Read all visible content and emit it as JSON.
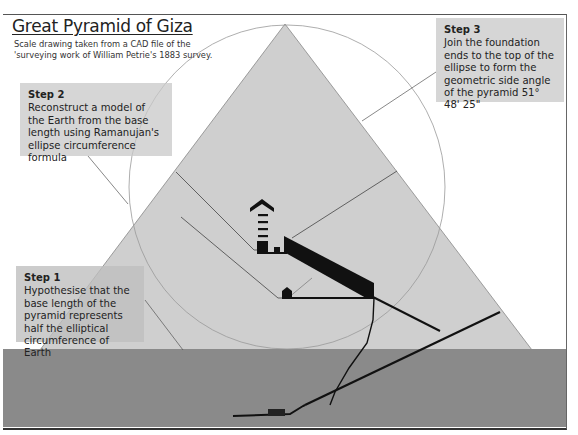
{
  "header": {
    "title": "Great Pyramid of Giza",
    "subtitle_line1": "Scale drawing taken from a CAD file of the",
    "subtitle_line2": "'surveying work of William Petrie's 1883 survey."
  },
  "steps": [
    {
      "label": "Step 1",
      "text": "Hypothesise that the base length of the pyramid represents half the elliptical circumference of Earth"
    },
    {
      "label": "Step 2",
      "text": "Reconstruct a model of the Earth from the base length using Ramanujan's ellipse circumference formula"
    },
    {
      "label": "Step 3",
      "text": "Join the foundation ends to the top of the ellipse to form the geometric side angle of the pyramid 51° 48' 25\""
    }
  ],
  "colors": {
    "pyramid": "#cfcfcf",
    "ground": "#8a8a8a",
    "passages": "#111111",
    "circle": "#999999",
    "step_box": "#c8c8c8"
  }
}
